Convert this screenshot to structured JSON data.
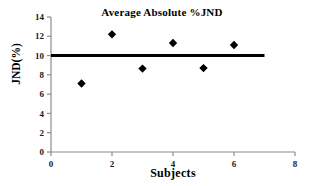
{
  "chart_data": {
    "type": "scatter",
    "title": "Average Absolute %JND",
    "xlabel": "Subjects",
    "ylabel": "JND(%)",
    "x": [
      1,
      2,
      3,
      4,
      5,
      6
    ],
    "values": [
      7.1,
      12.2,
      8.65,
      11.3,
      8.7,
      11.1
    ],
    "series": [
      {
        "name": "Average Absolute %JND",
        "marker": "diamond",
        "color": "#000000",
        "x": [
          1,
          2,
          3,
          4,
          5,
          6
        ],
        "values": [
          7.1,
          12.2,
          8.65,
          11.3,
          8.7,
          11.1
        ]
      }
    ],
    "reference_line": {
      "orientation": "horizontal",
      "y": 10,
      "x_start": 0,
      "x_end": 7,
      "color": "#000000",
      "width": 3
    },
    "xlim": [
      0,
      8
    ],
    "ylim": [
      0,
      14
    ],
    "xticks": [
      0,
      2,
      4,
      6,
      8
    ],
    "yticks": [
      0,
      2,
      4,
      6,
      8,
      10,
      12,
      14
    ],
    "xtick_labels": [
      "0",
      "2",
      "4",
      "6",
      "8"
    ],
    "ytick_labels": [
      "0",
      "2",
      "4",
      "6",
      "8",
      "10",
      "12",
      "14"
    ],
    "grid": false,
    "legend": null,
    "axis_color": "#8c8c8c",
    "background": "#ffffff"
  },
  "axes": {
    "x": {
      "label": "Subjects",
      "ticks": [
        {
          "value": 0,
          "label": "0"
        },
        {
          "value": 2,
          "label": "2"
        },
        {
          "value": 4,
          "label": "4"
        },
        {
          "value": 6,
          "label": "6"
        },
        {
          "value": 8,
          "label": "8"
        }
      ]
    },
    "y": {
      "label": "JND(%)",
      "ticks": [
        {
          "value": 0,
          "label": "0"
        },
        {
          "value": 2,
          "label": "2"
        },
        {
          "value": 4,
          "label": "4"
        },
        {
          "value": 6,
          "label": "6"
        },
        {
          "value": 8,
          "label": "8"
        },
        {
          "value": 10,
          "label": "10"
        },
        {
          "value": 12,
          "label": "12"
        },
        {
          "value": 14,
          "label": "14"
        }
      ]
    }
  }
}
